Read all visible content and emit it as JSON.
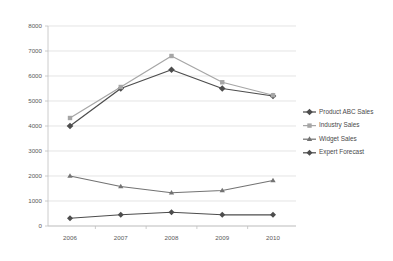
{
  "chart_data": {
    "type": "line",
    "title": "",
    "subtitle": "",
    "xlabel": "",
    "ylabel": "",
    "categories": [
      "2006",
      "2007",
      "2008",
      "2009",
      "2010"
    ],
    "x": [
      2006,
      2007,
      2008,
      2009,
      2010
    ],
    "ylim": [
      0,
      8000
    ],
    "ytick_labels": [
      "0",
      "1000",
      "2000",
      "3000",
      "4000",
      "5000",
      "6000",
      "7000",
      "8000"
    ],
    "ytick_values": [
      0,
      1000,
      2000,
      3000,
      4000,
      5000,
      6000,
      7000,
      8000
    ],
    "grid": true,
    "legend_position": "right",
    "series": [
      {
        "name": "Product ABC Sales",
        "values": [
          4000,
          5500,
          6250,
          5500,
          5200
        ],
        "color": "#4d4d4d",
        "marker": "diamond"
      },
      {
        "name": "Industry Sales",
        "values": [
          4320,
          5560,
          6800,
          5750,
          5230
        ],
        "color": "#a6a6a6",
        "marker": "square"
      },
      {
        "name": "Widget Sales",
        "values": [
          2000,
          1580,
          1330,
          1420,
          1820
        ],
        "color": "#737373",
        "marker": "triangle"
      },
      {
        "name": "Expert Forecast",
        "values": [
          310,
          450,
          550,
          450,
          450
        ],
        "color": "#4d4d4d",
        "marker": "small-diamond"
      }
    ]
  },
  "legend": {
    "items": [
      {
        "label": "Product ABC Sales"
      },
      {
        "label": "Industry Sales"
      },
      {
        "label": "Widget Sales"
      },
      {
        "label": "Expert Forecast"
      }
    ]
  },
  "axes": {
    "y_labels": [
      "8000",
      "7000",
      "6000",
      "5000",
      "4000",
      "3000",
      "2000",
      "1000",
      "0"
    ],
    "x_labels": [
      "2006",
      "2007",
      "2008",
      "2009",
      "2010"
    ]
  },
  "colors": {
    "background": "#ffffff",
    "grid": "#d9d9d9",
    "axis": "#bfbfbf",
    "text": "#595959",
    "product_abc": "#4d4d4d",
    "industry": "#a6a6a6",
    "widget": "#737373",
    "expert_forecast": "#4d4d4d"
  }
}
